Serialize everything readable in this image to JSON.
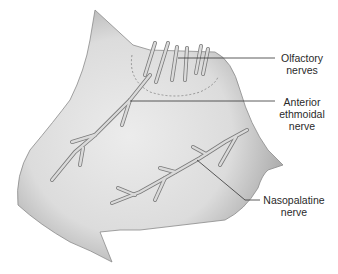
{
  "figure": {
    "labels": [
      {
        "id": "olfactory",
        "line1": "Olfactory",
        "line2": "nerves",
        "line3": ""
      },
      {
        "id": "anterior-ethmoidal",
        "line1": "Anterior",
        "line2": "ethmoidal",
        "line3": "nerve"
      },
      {
        "id": "nasopalatine",
        "line1": "Nasopalatine",
        "line2": "nerve",
        "line3": ""
      }
    ],
    "colors": {
      "septum_fill": "#c8c8c8",
      "septum_light": "#e8e8e8",
      "nerve_fill": "#d6d6d6",
      "nerve_stroke": "#7a7a7a",
      "leader_line": "#333333"
    }
  }
}
